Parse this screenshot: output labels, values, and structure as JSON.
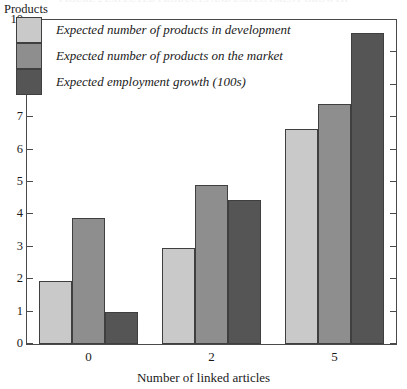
{
  "figure": {
    "title": "FIGURE 2 EXPECTED PRODUCTS AND EMPLOYMENT GROWTH"
  },
  "chart_data": {
    "type": "bar",
    "title": "",
    "xlabel": "Number of linked articles",
    "ylabel": "Products",
    "categories": [
      "0",
      "2",
      "5"
    ],
    "ylim": [
      0,
      10
    ],
    "yticks": [
      "0",
      "1",
      "2",
      "3",
      "4",
      "5",
      "6",
      "7",
      "8",
      "9",
      "10"
    ],
    "grid": false,
    "legend_position": "top-left-inside",
    "series": [
      {
        "name": "Expected number of products in development",
        "color": "#c9c9c9",
        "values": [
          1.95,
          2.95,
          6.65
        ]
      },
      {
        "name": "Expected number of products on the market",
        "color": "#8e8e8e",
        "values": [
          3.9,
          4.9,
          7.4
        ]
      },
      {
        "name": "Expected employment growth (100s)",
        "color": "#555555",
        "values": [
          1.0,
          4.45,
          9.6
        ]
      }
    ]
  }
}
